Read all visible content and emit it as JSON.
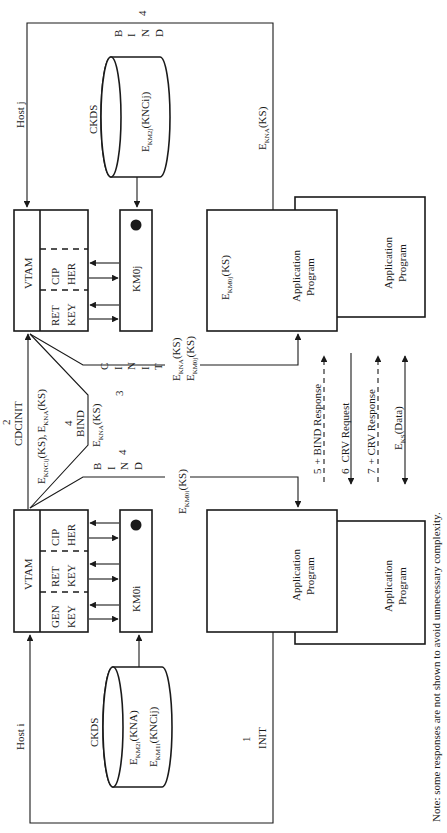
{
  "diagram": {
    "orientation": "rotated 90 degrees counter-clockwise",
    "hosts": {
      "host_j": {
        "label": "Host j",
        "vtam": {
          "label": "VTAM",
          "functions": [
            "CIP HER",
            "RET KEY"
          ],
          "functions_lines": [
            [
              "CIP",
              "HER"
            ],
            [
              "RET",
              "KEY"
            ]
          ]
        },
        "master_key": "KM0j",
        "ckds": {
          "label": "CKDS",
          "entries": [
            "E_KM2j(KNCij)"
          ],
          "entry_parts": [
            {
              "base": "E",
              "sub": "KM2j",
              "arg": "(KNCij)"
            }
          ]
        },
        "app_primary": {
          "label_lines": [
            "Application",
            "Program"
          ],
          "key_label": {
            "base": "E",
            "sub": "KM0j",
            "arg": "(KS)"
          }
        },
        "app_secondary": {
          "label_lines": [
            "Application",
            "Program"
          ]
        }
      },
      "host_i": {
        "label": "Host i",
        "vtam": {
          "label": "VTAM",
          "functions": [
            "CIP HER",
            "RET KEY",
            "GEN KEY"
          ],
          "functions_lines": [
            [
              "CIP",
              "HER"
            ],
            [
              "RET",
              "KEY"
            ],
            [
              "GEN",
              "KEY"
            ]
          ]
        },
        "master_key": "KM0i",
        "ckds": {
          "label": "CKDS",
          "entries": [
            "E_KM2i(KNA)",
            "E_KM1i(KNCij)"
          ],
          "entry_parts": [
            {
              "base": "E",
              "sub": "KM2i",
              "arg": "(KNA)"
            },
            {
              "base": "E",
              "sub": "KM1i",
              "arg": "(KNCij)"
            }
          ]
        },
        "app_primary": {
          "label_lines": [
            "Application",
            "Program"
          ]
        },
        "app_secondary": {
          "label_lines": [
            "Application",
            "Program"
          ]
        }
      }
    },
    "messages": {
      "init": {
        "step": "1",
        "label": "INIT"
      },
      "cdcinit": {
        "step": "2",
        "label": "CDCINIT",
        "payload": [
          {
            "base": "E",
            "sub": "KNCij",
            "arg": "(KS),"
          },
          {
            "base": "E",
            "sub": "KNA",
            "arg": "(KS)"
          }
        ]
      },
      "cinit": {
        "step": "3",
        "label_chars": [
          "C",
          "I",
          "N",
          "I",
          "T"
        ],
        "payload": [
          {
            "base": "E",
            "sub": "KNA",
            "arg": "(KS)"
          },
          {
            "base": "E",
            "sub": "KM0j",
            "arg": "(KS)"
          }
        ]
      },
      "bind_cross": {
        "step": "4",
        "label": "BIND",
        "payload": {
          "base": "E",
          "sub": "KNA",
          "arg": "(KS)"
        }
      },
      "bind_i": {
        "step": "4",
        "label_chars": [
          "B",
          "I",
          "N",
          "D"
        ],
        "payload": {
          "base": "E",
          "sub": "KM0i",
          "arg": "(KS)"
        }
      },
      "bind_j": {
        "step": "4",
        "label_chars": [
          "B",
          "I",
          "N",
          "D"
        ],
        "payload": {
          "base": "E",
          "sub": "KNA",
          "arg": "(KS)"
        }
      }
    },
    "session_flows": [
      {
        "step": "5",
        "label": "+ BIND Response",
        "style": "dashed",
        "direction": "to host j"
      },
      {
        "step": "6",
        "label": "CRV Request",
        "style": "solid",
        "direction": "to host i"
      },
      {
        "step": "7",
        "label": "+ CRV Response",
        "style": "dashed",
        "direction": "to host j"
      },
      {
        "step": "",
        "label": "E_KS(Data)",
        "label_parts": {
          "base": "E",
          "sub": "KS",
          "arg": "(Data)"
        },
        "style": "solid",
        "direction": "bidirectional"
      }
    ],
    "note": "Note: some responses are not shown to avoid unnecessary complexity."
  }
}
